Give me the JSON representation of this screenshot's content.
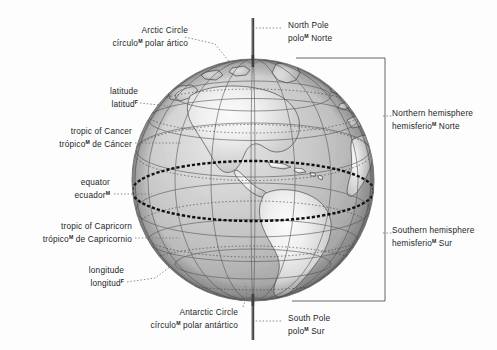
{
  "figure": {
    "background_color": "#fdfdfd",
    "text_color": "#221f1f"
  },
  "globe": {
    "center_x": 253,
    "center_y": 180,
    "radius": 121,
    "axis_tilt_deg": 0,
    "continent_region": "the Americas",
    "ocean_color_light": "#d9d9d9",
    "ocean_color_dark": "#9a9a9a",
    "land_color_light": "#f2f2f2",
    "land_color_dark": "#b4b4b4",
    "grid_color": "#5a5a5a",
    "equator_color": "#111111",
    "axis_pin_color": "#3a3a3a"
  },
  "gender_marker": "M",
  "labels": {
    "arctic_circle": {
      "en": "Arctic Circle",
      "es_before": "círculo",
      "es_marker": "M",
      "es_after": " polar ártico"
    },
    "latitude": {
      "en": "latitude",
      "es_before": "latitud",
      "es_marker": "F",
      "es_after": ""
    },
    "tropic_of_cancer": {
      "en": "tropic of Cancer",
      "es_before": "trópico",
      "es_marker": "M",
      "es_after": " de Cáncer"
    },
    "equator": {
      "en": "equator",
      "es_before": "ecuador",
      "es_marker": "M",
      "es_after": ""
    },
    "tropic_of_capricorn": {
      "en": "tropic of Capricorn",
      "es_before": "trópico",
      "es_marker": "M",
      "es_after": " de Capricornio"
    },
    "longitude": {
      "en": "longitude",
      "es_before": "longitud",
      "es_marker": "F",
      "es_after": ""
    },
    "antarctic_circle": {
      "en": "Antarctic Circle",
      "es_before": "círculo",
      "es_marker": "M",
      "es_after": " polar antártico"
    },
    "north_pole": {
      "en": "North Pole",
      "es_before": "polo",
      "es_marker": "M",
      "es_after": " Norte"
    },
    "south_pole": {
      "en": "South Pole",
      "es_before": "polo",
      "es_marker": "M",
      "es_after": " Sur"
    },
    "northern_hemisphere": {
      "en": "Northern hemisphere",
      "es_before": "hemisferio",
      "es_marker": "M",
      "es_after": " Norte"
    },
    "southern_hemisphere": {
      "en": "Southern hemisphere",
      "es_before": "hemisferio",
      "es_marker": "M",
      "es_after": " Sur"
    }
  }
}
